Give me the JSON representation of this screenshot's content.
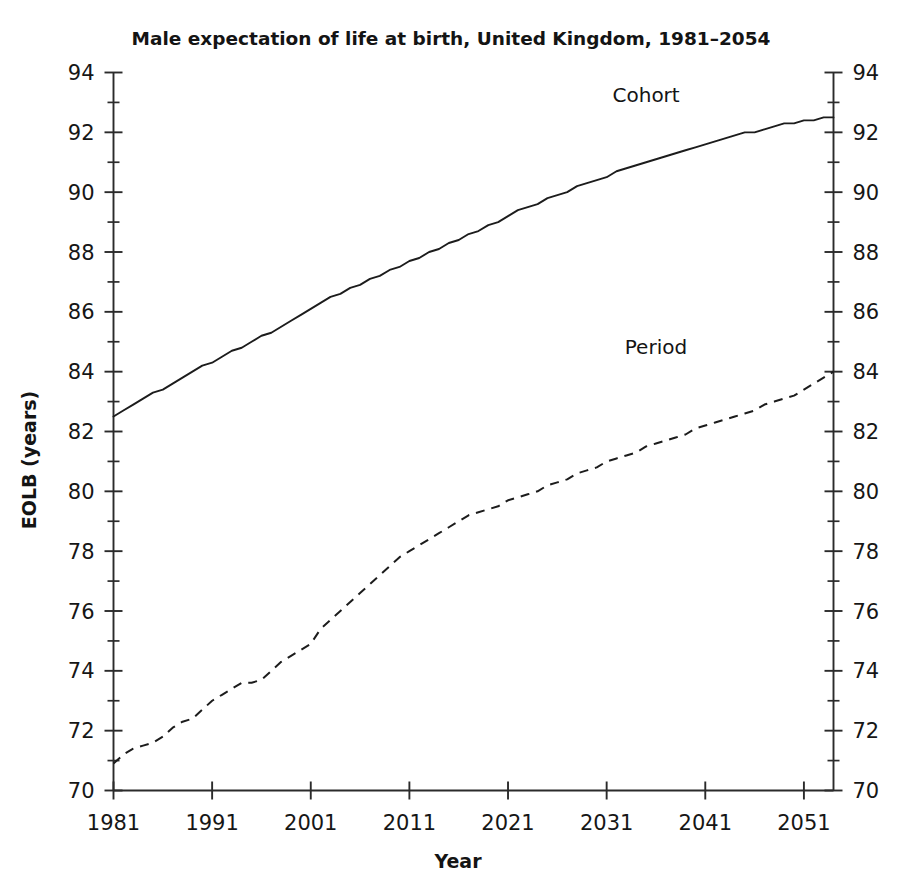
{
  "chart_data": {
    "type": "line",
    "title": "Male expectation of life at birth, United Kingdom, 1981–2054",
    "xlabel": "Year",
    "ylabel": "EOLB (years)",
    "xlim": [
      1981,
      2054
    ],
    "ylim": [
      70,
      94
    ],
    "x_ticks": [
      1981,
      1991,
      2001,
      2011,
      2021,
      2031,
      2041,
      2051
    ],
    "x_tick_labels": [
      "1981",
      "1991",
      "2001",
      "2011",
      "2021",
      "2031",
      "2041",
      "2051"
    ],
    "y_ticks": [
      70,
      72,
      74,
      76,
      78,
      80,
      82,
      84,
      86,
      88,
      90,
      92,
      94
    ],
    "y_tick_labels": [
      "70",
      "72",
      "74",
      "76",
      "78",
      "80",
      "82",
      "84",
      "86",
      "88",
      "90",
      "92",
      "94"
    ],
    "y_minor_step": 1,
    "grid": false,
    "legend_position": "inline-annotations",
    "right_axis_mirrors_left": true,
    "series": [
      {
        "name": "Cohort",
        "style": "solid",
        "label_x": 2035,
        "label_y": 93.0,
        "x": [
          1981,
          1982,
          1983,
          1984,
          1985,
          1986,
          1987,
          1988,
          1989,
          1990,
          1991,
          1992,
          1993,
          1994,
          1995,
          1996,
          1997,
          1998,
          1999,
          2000,
          2001,
          2002,
          2003,
          2004,
          2005,
          2006,
          2007,
          2008,
          2009,
          2010,
          2011,
          2012,
          2013,
          2014,
          2015,
          2016,
          2017,
          2018,
          2019,
          2020,
          2021,
          2022,
          2023,
          2024,
          2025,
          2026,
          2027,
          2028,
          2029,
          2030,
          2031,
          2032,
          2033,
          2034,
          2035,
          2036,
          2037,
          2038,
          2039,
          2040,
          2041,
          2042,
          2043,
          2044,
          2045,
          2046,
          2047,
          2048,
          2049,
          2050,
          2051,
          2052,
          2053,
          2054
        ],
        "values": [
          82.5,
          82.7,
          82.9,
          83.1,
          83.3,
          83.4,
          83.6,
          83.8,
          84.0,
          84.2,
          84.3,
          84.5,
          84.7,
          84.8,
          85.0,
          85.2,
          85.3,
          85.5,
          85.7,
          85.9,
          86.1,
          86.3,
          86.5,
          86.6,
          86.8,
          86.9,
          87.1,
          87.2,
          87.4,
          87.5,
          87.7,
          87.8,
          88.0,
          88.1,
          88.3,
          88.4,
          88.6,
          88.7,
          88.9,
          89.0,
          89.2,
          89.4,
          89.5,
          89.6,
          89.8,
          89.9,
          90.0,
          90.2,
          90.3,
          90.4,
          90.5,
          90.7,
          90.8,
          90.9,
          91.0,
          91.1,
          91.2,
          91.3,
          91.4,
          91.5,
          91.6,
          91.7,
          91.8,
          91.9,
          92.0,
          92.0,
          92.1,
          92.2,
          92.3,
          92.3,
          92.4,
          92.4,
          92.5,
          92.5
        ]
      },
      {
        "name": "Period",
        "style": "dashed",
        "label_x": 2036,
        "label_y": 84.6,
        "x": [
          1981,
          1982,
          1983,
          1984,
          1985,
          1986,
          1987,
          1988,
          1989,
          1990,
          1991,
          1992,
          1993,
          1994,
          1995,
          1996,
          1997,
          1998,
          1999,
          2000,
          2001,
          2002,
          2003,
          2004,
          2005,
          2006,
          2007,
          2008,
          2009,
          2010,
          2011,
          2012,
          2013,
          2014,
          2015,
          2016,
          2017,
          2018,
          2019,
          2020,
          2021,
          2022,
          2023,
          2024,
          2025,
          2026,
          2027,
          2028,
          2029,
          2030,
          2031,
          2032,
          2033,
          2034,
          2035,
          2036,
          2037,
          2038,
          2039,
          2040,
          2041,
          2042,
          2043,
          2044,
          2045,
          2046,
          2047,
          2048,
          2049,
          2050,
          2051,
          2052,
          2053,
          2054
        ],
        "values": [
          70.9,
          71.2,
          71.4,
          71.5,
          71.6,
          71.8,
          72.1,
          72.3,
          72.4,
          72.7,
          73.0,
          73.2,
          73.4,
          73.6,
          73.6,
          73.7,
          74.0,
          74.3,
          74.5,
          74.7,
          74.9,
          75.4,
          75.7,
          76.0,
          76.3,
          76.6,
          76.9,
          77.2,
          77.5,
          77.8,
          78.0,
          78.2,
          78.4,
          78.6,
          78.8,
          79.0,
          79.2,
          79.3,
          79.4,
          79.5,
          79.7,
          79.8,
          79.9,
          80.0,
          80.2,
          80.3,
          80.4,
          80.6,
          80.7,
          80.8,
          81.0,
          81.1,
          81.2,
          81.3,
          81.5,
          81.6,
          81.7,
          81.8,
          81.9,
          82.1,
          82.2,
          82.3,
          82.4,
          82.5,
          82.6,
          82.7,
          82.9,
          83.0,
          83.1,
          83.2,
          83.4,
          83.6,
          83.8,
          84.0
        ]
      }
    ]
  }
}
